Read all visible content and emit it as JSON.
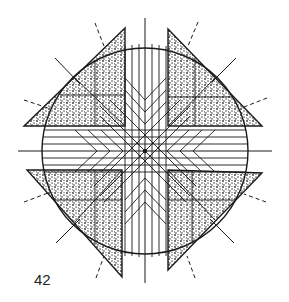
{
  "figure": {
    "label": "42",
    "colors": {
      "ink": "#1a1a1a",
      "background": "#ffffff",
      "stipple": "#555555"
    },
    "center": [
      145,
      151
    ],
    "circle_radius": 103
  }
}
